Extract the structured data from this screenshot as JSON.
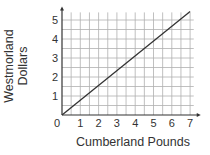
{
  "chart_data": {
    "type": "line",
    "title": "",
    "xlabel": "Cumberland Pounds",
    "ylabel": "Westmorland Dollars",
    "ylabel_lines": [
      "Westmorland",
      "Dollars"
    ],
    "x_ticks": [
      "0",
      "1",
      "2",
      "3",
      "4",
      "5",
      "6",
      "7"
    ],
    "y_ticks": [
      "1",
      "2",
      "3",
      "4",
      "5"
    ],
    "xlim": [
      0,
      7.2
    ],
    "ylim": [
      0,
      5.4
    ],
    "grid": true,
    "grid_step": 0.5,
    "legend": null,
    "series": [
      {
        "name": "exchange",
        "x": [
          0,
          7
        ],
        "y": [
          0,
          5.45
        ]
      }
    ],
    "colors": {
      "line": "#333333",
      "grid": "#b0b0b0",
      "axis": "#333333"
    }
  }
}
